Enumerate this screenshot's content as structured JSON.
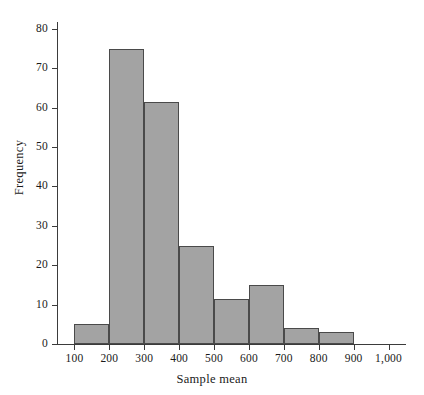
{
  "chart_data": {
    "type": "bar",
    "title": "",
    "subtitle": "",
    "xlabel": "Sample mean",
    "ylabel": "Frequency",
    "grid": false,
    "legend": null,
    "bin_width": 100,
    "xlim": [
      50,
      1050
    ],
    "ylim": [
      0,
      82
    ],
    "x_ticks": [
      "100",
      "200",
      "300",
      "400",
      "500",
      "600",
      "700",
      "800",
      "900",
      "1,000"
    ],
    "x_tick_values": [
      100,
      200,
      300,
      400,
      500,
      600,
      700,
      800,
      900,
      1000
    ],
    "y_ticks": [
      "0",
      "10",
      "20",
      "30",
      "40",
      "50",
      "60",
      "70",
      "80"
    ],
    "y_tick_values": [
      0,
      10,
      20,
      30,
      40,
      50,
      60,
      70,
      80
    ],
    "categories": [
      "100-200",
      "200-300",
      "300-400",
      "400-500",
      "500-600",
      "600-700",
      "700-800",
      "800-900"
    ],
    "bin_starts": [
      100,
      200,
      300,
      400,
      500,
      600,
      700,
      800
    ],
    "bin_ends": [
      200,
      300,
      400,
      500,
      600,
      700,
      800,
      900
    ],
    "values": [
      5,
      75,
      61.5,
      25,
      11.5,
      15,
      4,
      3
    ],
    "bar_fill_color": "#a3a3a3",
    "bar_edge_color": "#4a4a4a",
    "axis_color": "#3b3b3b",
    "background_color": "#ffffff"
  }
}
